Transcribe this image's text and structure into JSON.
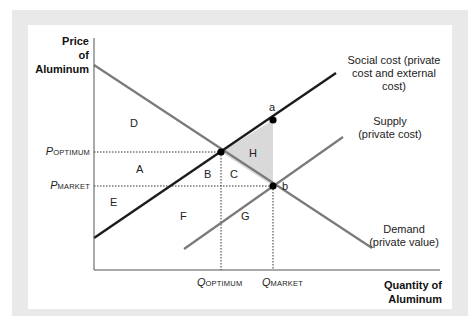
{
  "axes": {
    "y_title": [
      "Price",
      "of",
      "Aluminum"
    ],
    "x_title": [
      "Quantity of",
      "Aluminum"
    ]
  },
  "curves": {
    "social_cost": {
      "label": [
        "Social cost (private",
        "cost and external",
        "cost)"
      ],
      "color": "#1c1c1c"
    },
    "supply": {
      "label": [
        "Supply",
        "(private cost)"
      ],
      "color": "#7a7a7a"
    },
    "demand": {
      "label": [
        "Demand",
        "(private value)"
      ],
      "color": "#7a7a7a"
    }
  },
  "prices": {
    "optimum": {
      "main": "P",
      "sub": "OPTIMUM"
    },
    "market": {
      "main": "P",
      "sub": "MARKET"
    }
  },
  "quantities": {
    "optimum": {
      "main": "Q",
      "sub": "OPTIMUM"
    },
    "market": {
      "main": "Q",
      "sub": "MARKET"
    }
  },
  "regions": [
    "A",
    "B",
    "C",
    "D",
    "E",
    "F",
    "G",
    "H"
  ],
  "points": {
    "a": "a",
    "b": "b"
  },
  "colors": {
    "shaded_region": "#d9d9d9",
    "frame": "#e9e9e9"
  }
}
